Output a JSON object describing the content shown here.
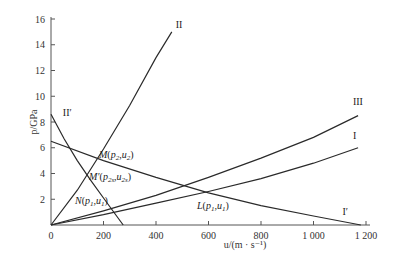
{
  "chart_data": {
    "type": "line",
    "title": "",
    "xlabel": "u/(m · s⁻¹)",
    "ylabel": "p/GPa",
    "xlim": [
      0,
      1200
    ],
    "ylim": [
      0,
      16
    ],
    "xticks": [
      0,
      200,
      400,
      600,
      800,
      1000,
      1200
    ],
    "xtick_labels": [
      "0",
      "200",
      "400",
      "600",
      "800",
      "1 000",
      "1 200"
    ],
    "yticks": [
      2,
      4,
      6,
      8,
      10,
      12,
      14,
      16
    ],
    "ytick_labels": [
      "2",
      "4",
      "6",
      "8",
      "10",
      "12",
      "14",
      "16"
    ],
    "grid": false,
    "series": [
      {
        "name": "II",
        "x": [
          0,
          100,
          200,
          300,
          400,
          460
        ],
        "y": [
          0,
          2.7,
          5.9,
          9.3,
          13.0,
          15.0
        ]
      },
      {
        "name": "II'",
        "x": [
          0,
          50,
          100,
          150,
          200,
          250,
          275
        ],
        "y": [
          8.6,
          6.7,
          5.0,
          3.5,
          2.1,
          0.7,
          0
        ]
      },
      {
        "name": "III",
        "x": [
          0,
          200,
          400,
          600,
          800,
          1000,
          1170
        ],
        "y": [
          0,
          1.1,
          2.3,
          3.7,
          5.2,
          6.8,
          8.5
        ]
      },
      {
        "name": "I",
        "x": [
          0,
          200,
          400,
          600,
          800,
          1000,
          1170
        ],
        "y": [
          0,
          0.8,
          1.7,
          2.6,
          3.6,
          4.8,
          6.0
        ]
      },
      {
        "name": "I'",
        "x": [
          0,
          200,
          400,
          600,
          800,
          1000,
          1180
        ],
        "y": [
          6.5,
          5.0,
          3.7,
          2.5,
          1.5,
          0.7,
          0
        ]
      }
    ],
    "annotations": [
      {
        "label_parts": [
          "M(",
          "p",
          "2",
          ",",
          "u",
          "2",
          ")"
        ],
        "text": "M(p2,u2)",
        "x": 165,
        "y": 5.1
      },
      {
        "label_parts": [
          "M′(",
          "p",
          "2s",
          ",",
          "u",
          "2s",
          ")"
        ],
        "text": "M′(p2s,u2s)",
        "x": 125,
        "y": 3.8
      },
      {
        "label_parts": [
          "N(",
          "p",
          "1",
          ",",
          "u",
          "1",
          ")"
        ],
        "text": "N(p1,u1)",
        "x": 240,
        "y": 1.2
      },
      {
        "label_parts": [
          "L(",
          "p",
          "1",
          ",",
          "u",
          "1",
          ")"
        ],
        "text": "L(p1,u1)",
        "x": 610,
        "y": 2.4
      }
    ],
    "curve_labels": [
      {
        "text": "II",
        "series": "II"
      },
      {
        "text": "II′",
        "series": "II'"
      },
      {
        "text": "III",
        "series": "III"
      },
      {
        "text": "I",
        "series": "I"
      },
      {
        "text": "I′",
        "series": "I'"
      }
    ]
  }
}
